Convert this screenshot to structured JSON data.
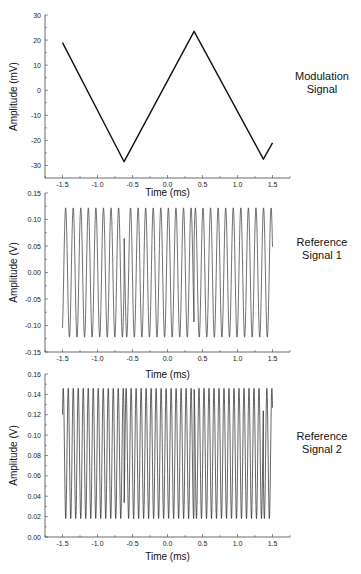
{
  "chart_data": [
    {
      "type": "line",
      "title": "Modulation Signal",
      "side_label_lines": [
        "Modulation",
        "Signal"
      ],
      "xlabel": "Time (ms)",
      "ylabel": "Amplitude (mV)",
      "xlim": [
        -1.75,
        1.75
      ],
      "ylim": [
        -35,
        30
      ],
      "xticks": [
        -1.5,
        -1.0,
        -0.5,
        0.0,
        0.5,
        1.0,
        1.5
      ],
      "xtick_labels": [
        "-1.5",
        "-1.0",
        "-0.5",
        "0.0",
        "0.5",
        "1.0",
        "1.5"
      ],
      "yticks": [
        -30,
        -20,
        -10,
        0,
        10,
        20,
        30
      ],
      "ytick_labels": [
        "-30",
        "-20",
        "-10",
        "0",
        "10",
        "20",
        "30"
      ],
      "series": [
        {
          "name": "Modulation Signal",
          "color": "#111111",
          "waveform": "triangle",
          "x": [
            -1.5,
            -0.62,
            0.38,
            1.37,
            1.5
          ],
          "y": [
            19,
            -28.5,
            23.5,
            -27.5,
            -21
          ]
        }
      ]
    },
    {
      "type": "line",
      "title": "Reference Signal 1",
      "side_label_lines": [
        "Reference",
        "Signal 1"
      ],
      "xlabel": "Time (ms)",
      "ylabel": "Amplitude (V)",
      "xlim": [
        -1.75,
        1.75
      ],
      "ylim": [
        -0.15,
        0.15
      ],
      "xticks": [
        -1.5,
        -1.0,
        -0.5,
        0.0,
        0.5,
        1.0,
        1.5
      ],
      "xtick_labels": [
        "-1.5",
        "-1.0",
        "-0.5",
        "0.0",
        "0.5",
        "1.0",
        "1.5"
      ],
      "yticks": [
        -0.15,
        -0.1,
        -0.05,
        0.0,
        0.05,
        0.1,
        0.15
      ],
      "ytick_labels": [
        "-0.15",
        "-0.10",
        "-0.05",
        "0.00",
        "0.05",
        "0.10",
        "0.15"
      ],
      "series": [
        {
          "name": "Reference Signal 1",
          "color": "#333333",
          "waveform": "sine",
          "x_start": -1.5,
          "x_end": 1.5,
          "offset": 0.0,
          "amplitude": 0.122,
          "frequency_khz": 9.25,
          "phase_jumps_ms": [
            -0.62,
            0.38
          ],
          "start_value": -0.105,
          "end_value": 0.105
        }
      ]
    },
    {
      "type": "line",
      "title": "Reference Signal 2",
      "side_label_lines": [
        "Reference",
        "Signal 2"
      ],
      "xlabel": "Time (ms)",
      "ylabel": "Amplitude (V)",
      "xlim": [
        -1.75,
        1.75
      ],
      "ylim": [
        0.0,
        0.16
      ],
      "xticks": [
        -1.5,
        -1.0,
        -0.5,
        0.0,
        0.5,
        1.0,
        1.5
      ],
      "xtick_labels": [
        "-1.5",
        "-1.0",
        "-0.5",
        "0.0",
        "0.5",
        "1.0",
        "1.5"
      ],
      "yticks": [
        0.0,
        0.02,
        0.04,
        0.06,
        0.08,
        0.1,
        0.12,
        0.14,
        0.16
      ],
      "ytick_labels": [
        "0.00",
        "0.02",
        "0.04",
        "0.06",
        "0.08",
        "0.10",
        "0.12",
        "0.14",
        "0.16"
      ],
      "series": [
        {
          "name": "Reference Signal 2",
          "color": "#222222",
          "waveform": "sine",
          "x_start": -1.5,
          "x_end": 1.5,
          "offset": 0.082,
          "amplitude": 0.064,
          "frequency_khz": 14.0,
          "phase_jumps_ms": [
            -0.62,
            0.38,
            1.37
          ],
          "start_value": 0.12,
          "end_value": 0.03
        }
      ]
    }
  ]
}
